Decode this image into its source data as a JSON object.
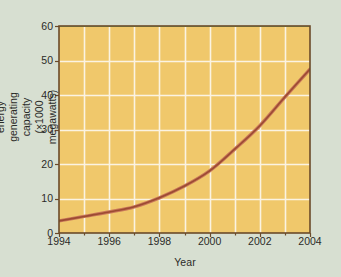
{
  "chart_data": {
    "type": "line",
    "title": "",
    "xlabel": "Year",
    "ylabel": "World wind energy generating capacity (×1000 megawatts)",
    "ylabel_line1": "World wind energy generating",
    "ylabel_line2": "capacity (×1000 megawatts)",
    "xlim": [
      1994,
      2004
    ],
    "ylim": [
      0,
      60
    ],
    "xticks": [
      1994,
      1996,
      1998,
      2000,
      2002,
      2004
    ],
    "xtick_labels": [
      "1994",
      "1996",
      "1998",
      "2000",
      "2002",
      "2004"
    ],
    "yticks": [
      0,
      10,
      20,
      30,
      40,
      50,
      60
    ],
    "ytick_labels": [
      "0",
      "10",
      "20",
      "30",
      "40",
      "50",
      "60"
    ],
    "grid": true,
    "grid_x_step": 1,
    "grid_y_step": 10,
    "legend": "none",
    "series": [
      {
        "name": "World wind energy generating capacity",
        "color": "#9c4b32",
        "x": [
          1994,
          1995,
          1996,
          1997,
          1998,
          1999,
          2000,
          2001,
          2002,
          2003,
          2004
        ],
        "values": [
          3.5,
          4.8,
          6.1,
          7.6,
          10.2,
          13.6,
          18.0,
          24.3,
          31.1,
          39.4,
          47.5
        ]
      }
    ]
  },
  "style": {
    "page_background": "#d7dfd1",
    "plot_background": "#f0c86b",
    "grid_color": "#fbf3e2",
    "border_color": "#6b4a2a",
    "curve_color": "#9c4b32",
    "curve_highlight": "#c9775a",
    "top_accent_color": "#7ec46a",
    "text_color": "#2b2b28"
  },
  "plot_box": {
    "left": 59,
    "top": 26,
    "right": 310,
    "bottom": 233
  }
}
